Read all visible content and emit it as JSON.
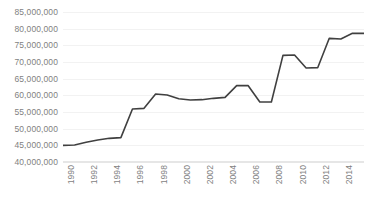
{
  "chart_data": {
    "type": "line",
    "title": "",
    "subtitle": "",
    "xlabel": "",
    "ylabel": "",
    "grid": true,
    "legend": false,
    "legend_position": "none",
    "line_color": "#404040",
    "gridline_color": "#f2f2f2",
    "label_color": "#7f7f7f",
    "xlim": [
      1990,
      2016
    ],
    "ylim": [
      40000000,
      85000000
    ],
    "y_ticks": [
      40000000,
      45000000,
      50000000,
      55000000,
      60000000,
      65000000,
      70000000,
      75000000,
      80000000,
      85000000
    ],
    "y_tick_labels": [
      "40,000,000",
      "45,000,000",
      "50,000,000",
      "55,000,000",
      "60,000,000",
      "65,000,000",
      "70,000,000",
      "75,000,000",
      "80,000,000",
      "85,000,000"
    ],
    "x_ticks": [
      1990,
      1992,
      1994,
      1996,
      1998,
      2000,
      2002,
      2004,
      2006,
      2008,
      2010,
      2012,
      2014,
      2016
    ],
    "x_tick_labels": [
      "1990",
      "1992",
      "1994",
      "1996",
      "1998",
      "2000",
      "2002",
      "2004",
      "2006",
      "2008",
      "2010",
      "2012",
      "2014",
      "2016"
    ],
    "x": [
      1990,
      1991,
      1992,
      1993,
      1994,
      1995,
      1996,
      1997,
      1998,
      1999,
      2000,
      2001,
      2002,
      2003,
      2004,
      2005,
      2006,
      2007,
      2008,
      2009,
      2010,
      2011,
      2012,
      2013,
      2014,
      2015,
      2016
    ],
    "values": [
      45000000,
      45100000,
      45900000,
      46600000,
      47100000,
      47300000,
      55900000,
      56100000,
      60400000,
      60100000,
      59000000,
      58600000,
      58700000,
      59100000,
      59400000,
      62900000,
      62900000,
      58000000,
      58000000,
      72000000,
      72100000,
      68200000,
      68300000,
      77100000,
      76900000,
      78600000,
      78600000
    ],
    "series_name": ""
  }
}
